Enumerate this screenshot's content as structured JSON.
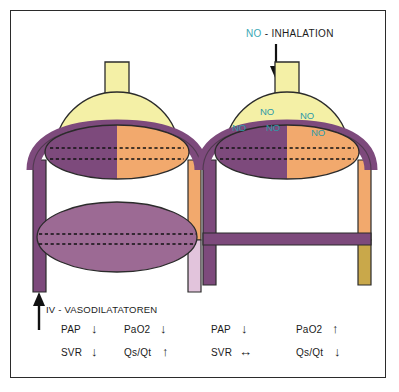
{
  "figure": {
    "type": "medical-diagram",
    "panels": [
      "left",
      "right"
    ]
  },
  "colors": {
    "alveolus": "#f4f0a6",
    "deoxygenated_blood": "#7d4a7c",
    "oxygenated_blood": "#f2a96d",
    "shunt_blood_light": "#e2c4dc",
    "mixed_blood_tan": "#c9a84a",
    "no_label": "#2e9aa8",
    "outline": "#2b2b2b",
    "frame": "#2b2b2b",
    "background": "#ffffff"
  },
  "right_panel": {
    "header": {
      "no": "NO",
      "rest": " - INHALATION"
    },
    "inhalation_arrow": "down-arrow",
    "no_labels": [
      "NO",
      "NO",
      "NO",
      "NO",
      "NO"
    ]
  },
  "left_panel": {
    "caption": "IV - VASODILATATOREN",
    "caption_arrow": "up-arrow"
  },
  "legend": {
    "left": [
      {
        "label": "PAP",
        "arrow": "down"
      },
      {
        "label": "PaO2",
        "arrow": "down"
      },
      {
        "label": "SVR",
        "arrow": "down"
      },
      {
        "label": "Qs/Qt",
        "arrow": "up"
      }
    ],
    "right": [
      {
        "label": "PAP",
        "arrow": "down"
      },
      {
        "label": "PaO2",
        "arrow": "up"
      },
      {
        "label": "SVR",
        "arrow": "both"
      },
      {
        "label": "Qs/Qt",
        "arrow": "down"
      }
    ]
  },
  "arrow_glyphs": {
    "up": "↑",
    "down": "↓",
    "both": "↔"
  }
}
